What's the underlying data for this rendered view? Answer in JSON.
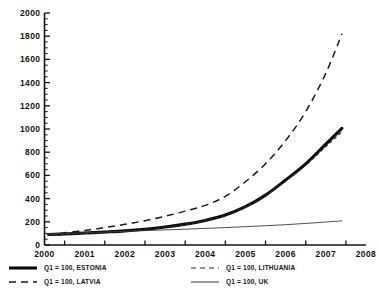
{
  "chart_data": {
    "type": "line",
    "title": "",
    "subtitle": "",
    "xlabel": "",
    "ylabel": "",
    "xlim": [
      2000,
      2008
    ],
    "ylim": [
      0,
      2000
    ],
    "grid": false,
    "legend_position": "bottom",
    "y_ticks": [
      "0",
      "200",
      "400",
      "600",
      "800",
      "1000",
      "1200",
      "1400",
      "1600",
      "1800",
      "2000"
    ],
    "y_tick_values": [
      0,
      200,
      400,
      600,
      800,
      1000,
      1200,
      1400,
      1600,
      1800,
      2000
    ],
    "y_minor_tick_step": 50,
    "x_ticks": [
      "2000",
      "2001",
      "2002",
      "2003",
      "2004",
      "2005",
      "2006",
      "2007",
      "2008"
    ],
    "x_tick_values": [
      2000,
      2001,
      2002,
      2003,
      2004,
      2005,
      2006,
      2007,
      2008
    ],
    "x": [
      2000.1,
      2000.5,
      2001.0,
      2001.5,
      2002.0,
      2002.5,
      2003.0,
      2003.5,
      2004.0,
      2004.5,
      2005.0,
      2005.5,
      2006.0,
      2006.5,
      2007.0,
      2007.4
    ],
    "series": [
      {
        "name": "Q1 = 100, ESTONIA",
        "style": "thick-solid",
        "color": "#0b0b0b",
        "values": [
          90,
          95,
          103,
          112,
          122,
          136,
          155,
          180,
          212,
          258,
          330,
          430,
          560,
          700,
          870,
          1005
        ]
      },
      {
        "name": "Q1 = 100, LATVIA",
        "style": "long-dash",
        "color": "#1a1a1a",
        "values": [
          92,
          105,
          125,
          150,
          178,
          210,
          248,
          292,
          342,
          420,
          545,
          700,
          900,
          1150,
          1480,
          1820
        ]
      },
      {
        "name": "Q1 = 100, LITHUANIA",
        "style": "short-dash",
        "color": "#2b2b2b",
        "values": [
          88,
          92,
          99,
          107,
          118,
          132,
          152,
          178,
          210,
          256,
          328,
          428,
          552,
          688,
          848,
          975
        ]
      },
      {
        "name": "Q1 = 100, UK",
        "style": "thin-solid",
        "color": "#3a3a3a",
        "values": [
          95,
          100,
          106,
          112,
          118,
          124,
          130,
          136,
          143,
          150,
          158,
          166,
          175,
          186,
          198,
          208
        ]
      }
    ],
    "legend": [
      {
        "label": "Q1 = 100, ESTONIA",
        "style": "thick-solid",
        "column": "left"
      },
      {
        "label": "Q1 = 100, LATVIA",
        "style": "long-dash",
        "column": "left"
      },
      {
        "label": "Q1 = 100, LITHUANIA",
        "style": "short-dash",
        "column": "right"
      },
      {
        "label": "Q1 = 100, UK",
        "style": "thin-solid",
        "column": "right"
      }
    ],
    "colors": {
      "background": "#ffffff",
      "axis": "#141414",
      "text": "#121212"
    }
  }
}
